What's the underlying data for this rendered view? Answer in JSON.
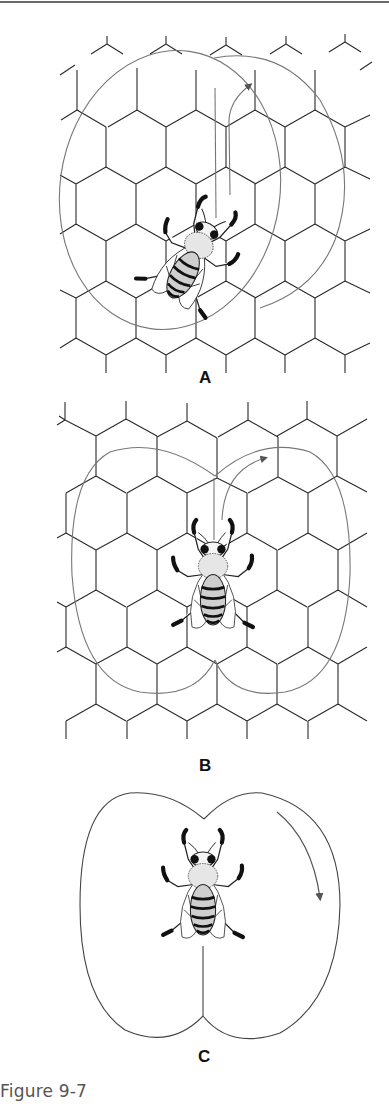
{
  "figure": {
    "caption": "Figure 9-7",
    "panels": [
      {
        "id": "A",
        "label": "A",
        "description": "Bee performing waggle dance on honeycomb, tilted orientation, arrow showing turn direction"
      },
      {
        "id": "B",
        "label": "B",
        "description": "Bee performing waggle dance on honeycomb, vertical orientation, arrow showing clockwise turn"
      },
      {
        "id": "C",
        "label": "C",
        "description": "Bee at centre of figure-eight waggle dance loop, arrow showing downward clockwise return"
      }
    ]
  },
  "colors": {
    "line": "#2a2a2a",
    "loop": "#777777",
    "caption": "#555555",
    "rule": "#6a6a6a"
  }
}
